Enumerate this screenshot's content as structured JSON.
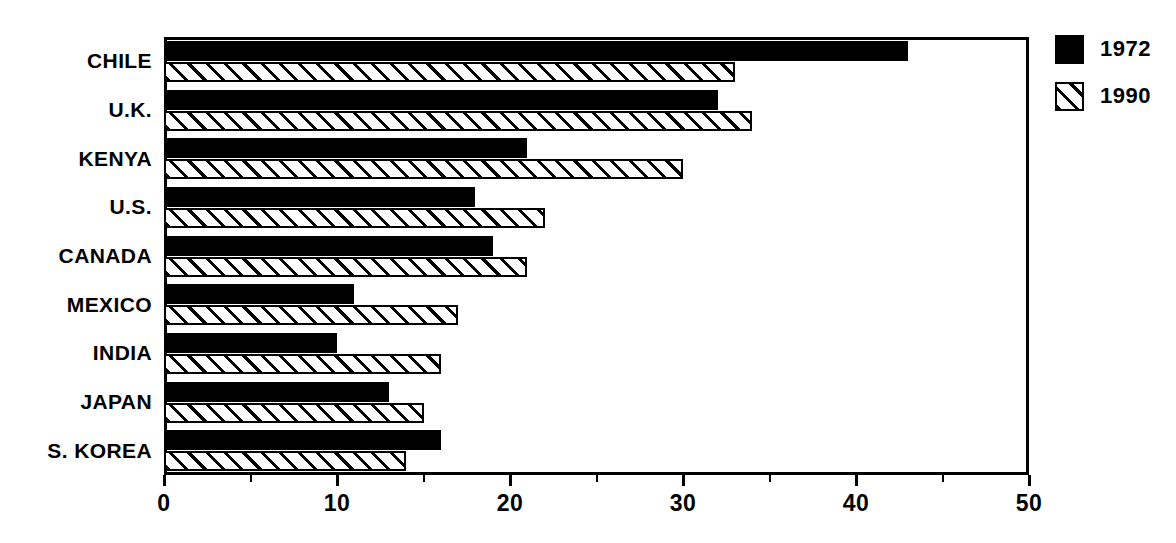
{
  "chart_data": {
    "type": "bar",
    "orientation": "horizontal",
    "title": "",
    "subtitle": "",
    "xlabel": "",
    "ylabel": "",
    "xlim": [
      0,
      50
    ],
    "xticks": [
      0,
      10,
      20,
      30,
      40,
      50
    ],
    "xtick_labels": [
      "0",
      "10",
      "20",
      "30",
      "40",
      "50"
    ],
    "minor_xticks": [
      5,
      15,
      25,
      35,
      45
    ],
    "grid": false,
    "legend_position": "right",
    "categories": [
      "CHILE",
      "U.K.",
      "KENYA",
      "U.S.",
      "CANADA",
      "MEXICO",
      "INDIA",
      "JAPAN",
      "S. KOREA"
    ],
    "series": [
      {
        "name": "1972",
        "fill": "solid-black",
        "color": "#000000",
        "values": [
          43,
          32,
          21,
          18,
          19,
          11,
          10,
          13,
          16
        ]
      },
      {
        "name": "1990",
        "fill": "diagonal-hatch",
        "color": "#ffffff",
        "values": [
          33,
          34,
          30,
          22,
          21,
          17,
          16,
          15,
          14
        ]
      }
    ]
  },
  "legend": {
    "entries": [
      {
        "label": "1972",
        "style": "series-1972"
      },
      {
        "label": "1990",
        "style": "series-1990"
      }
    ]
  },
  "axis": {
    "frame_color": "#000000"
  }
}
